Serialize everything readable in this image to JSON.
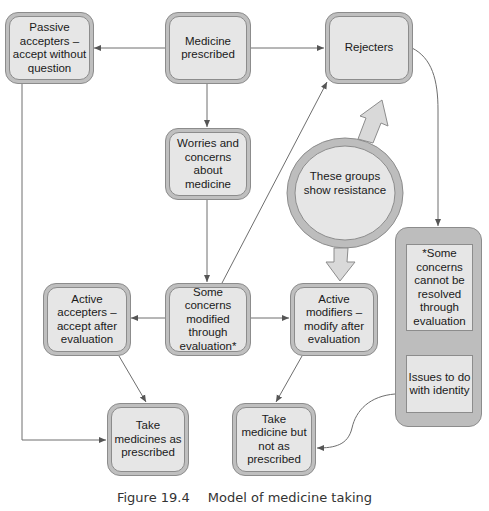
{
  "diagram": {
    "nodes": {
      "passive_accepters": "Passive accepters – accept without question",
      "medicine_prescribed": "Medicine prescribed",
      "rejecters": "Rejecters",
      "worries": "Worries and concerns about medicine",
      "resistance": "These groups show resistance",
      "active_accepters": "Active accepters – accept after evaluation",
      "some_concerns_modified": "Some concerns modified through evaluation*",
      "active_modifiers": "Active modifiers – modify after evaluation",
      "take_as_prescribed": "Take medicines as prescribed",
      "take_not_as_prescribed": "Take medicine but not as prescribed",
      "cannot_be_resolved": "*Some concerns cannot be resolved through evaluation",
      "identity_issues": "Issues to do with identity"
    },
    "edges": [
      {
        "from": "medicine_prescribed",
        "to": "passive_accepters"
      },
      {
        "from": "medicine_prescribed",
        "to": "rejecters"
      },
      {
        "from": "medicine_prescribed",
        "to": "worries"
      },
      {
        "from": "worries",
        "to": "some_concerns_modified"
      },
      {
        "from": "some_concerns_modified",
        "to": "active_accepters"
      },
      {
        "from": "some_concerns_modified",
        "to": "active_modifiers"
      },
      {
        "from": "some_concerns_modified",
        "to": "rejecters"
      },
      {
        "from": "passive_accepters",
        "to": "take_as_prescribed"
      },
      {
        "from": "active_accepters",
        "to": "take_as_prescribed"
      },
      {
        "from": "active_modifiers",
        "to": "take_not_as_prescribed"
      },
      {
        "from": "rejecters",
        "to": "cannot_be_resolved"
      },
      {
        "from": "identity_issues",
        "to": "take_not_as_prescribed"
      },
      {
        "from": "resistance",
        "to": "rejecters",
        "style": "block-arrow"
      },
      {
        "from": "resistance",
        "to": "active_modifiers",
        "style": "block-arrow"
      }
    ],
    "colors": {
      "box_outer": "#bfbfbf",
      "box_inner": "#e6e6e6",
      "border": "#8c8c8c",
      "line": "#6e6e6e"
    }
  },
  "caption": {
    "number": "Figure 19.4",
    "title": "Model of medicine taking"
  }
}
